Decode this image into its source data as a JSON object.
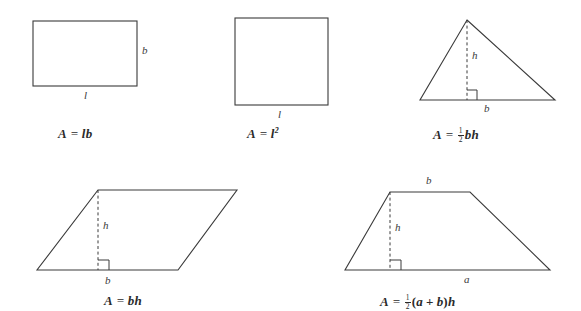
{
  "figure": {
    "stroke_color": "#3a3a3a",
    "text_color": "#2b2b2b",
    "background_color": "#ffffff"
  },
  "shapes": [
    {
      "id": "rectangle",
      "name": "rectangle",
      "labels": {
        "side_bottom": "l",
        "side_right": "b"
      },
      "formula": {
        "lhs": "A",
        "equals": "=",
        "rhs_parts": [
          "l",
          "b"
        ],
        "plain": "A = lb"
      }
    },
    {
      "id": "square",
      "name": "square",
      "labels": {
        "side_bottom": "l"
      },
      "formula": {
        "lhs": "A",
        "equals": "=",
        "base": "l",
        "exponent": "2",
        "plain": "A = l2"
      }
    },
    {
      "id": "triangle",
      "name": "triangle",
      "labels": {
        "base": "b",
        "height": "h"
      },
      "formula": {
        "lhs": "A",
        "equals": "=",
        "fraction_numerator": "1",
        "fraction_denominator": "2",
        "rhs_parts": [
          "b",
          "h"
        ],
        "plain": "A = 1/2 bh"
      }
    },
    {
      "id": "parallelogram",
      "name": "parallelogram",
      "labels": {
        "base": "b",
        "height": "h"
      },
      "formula": {
        "lhs": "A",
        "equals": "=",
        "rhs_parts": [
          "b",
          "h"
        ],
        "plain": "A = bh"
      }
    },
    {
      "id": "trapezium",
      "name": "trapezium",
      "labels": {
        "base_bottom": "a",
        "base_top": "b",
        "height": "h"
      },
      "formula": {
        "lhs": "A",
        "equals": "=",
        "fraction_numerator": "1",
        "fraction_denominator": "2",
        "open_paren": "(",
        "term_a": "a",
        "plus": "+",
        "term_b": "b",
        "close_paren": ")",
        "term_h": "h",
        "plain": "A = 1/2 (a + b)h"
      }
    }
  ]
}
